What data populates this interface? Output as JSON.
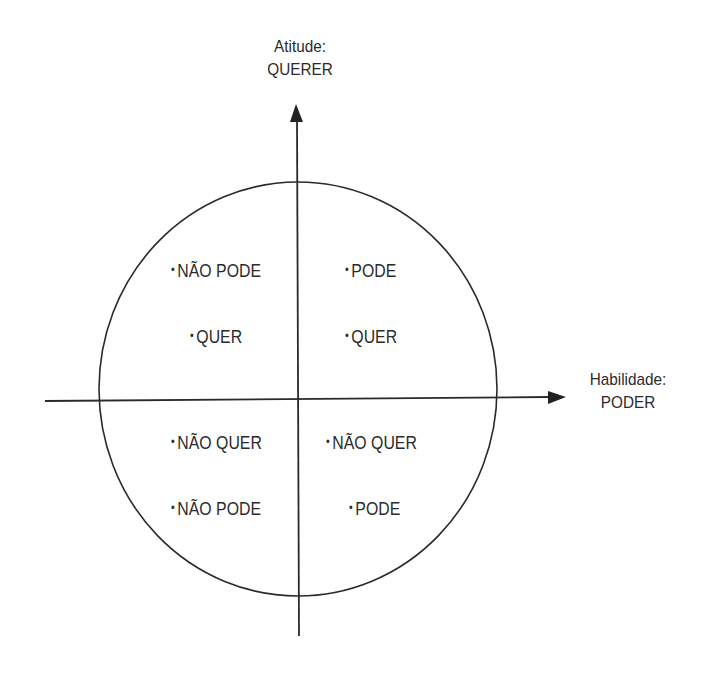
{
  "diagram": {
    "type": "quadrant",
    "y_axis": {
      "line1": "Atitude:",
      "line2": "QUERER"
    },
    "x_axis": {
      "line1": "Habilidade:",
      "line2": "PODER"
    },
    "quadrants": {
      "top_left": {
        "line1": "NÃO PODE",
        "line2": "QUER"
      },
      "top_right": {
        "line1": "PODE",
        "line2": "QUER"
      },
      "bottom_left": {
        "line1": "NÃO QUER",
        "line2": "NÃO PODE"
      },
      "bottom_right": {
        "line1": "NÃO QUER",
        "line2": "PODE"
      }
    },
    "bullet": "•",
    "colors": {
      "line": "#2a2a2a",
      "text": "#2b2b2b",
      "background": "#ffffff"
    }
  }
}
